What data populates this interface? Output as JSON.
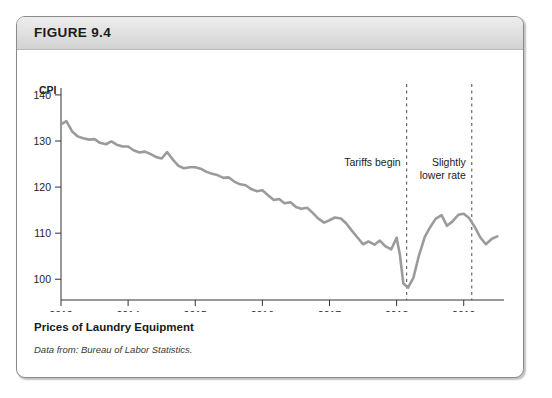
{
  "figure": {
    "label": "FIGURE 9.4",
    "caption_title": "Prices of Laundry Equipment",
    "caption_source": "Data from: Bureau of Labor Statistics."
  },
  "chart_data": {
    "type": "line",
    "title": "Prices of Laundry Equipment",
    "xlabel": "Year",
    "ylabel": "CPI",
    "xlim": [
      2013.0,
      2019.6
    ],
    "ylim": [
      95.5,
      141.5
    ],
    "grid": false,
    "legend": null,
    "x_tick_labels": [
      "2013",
      "2014",
      "2015",
      "2016",
      "2017",
      "2018",
      "2019"
    ],
    "x_ticks": [
      2013,
      2014,
      2015,
      2016,
      2017,
      2018,
      2019
    ],
    "y_tick_labels": [
      "140",
      "130",
      "120",
      "110",
      "100"
    ],
    "y_ticks": [
      140,
      130,
      120,
      110,
      100
    ],
    "series_name": "CPI for Laundry Equipment",
    "series_color": "#9b9b9b",
    "annotations": [
      {
        "text": "Tariffs begin",
        "x": 2018.15,
        "line": true
      },
      {
        "text": "Slightly lower rate",
        "x": 2019.12,
        "line": true
      }
    ],
    "points": [
      [
        2013.0,
        133.6
      ],
      [
        2013.08,
        134.3
      ],
      [
        2013.17,
        132.0
      ],
      [
        2013.25,
        131.0
      ],
      [
        2013.33,
        130.6
      ],
      [
        2013.42,
        130.3
      ],
      [
        2013.5,
        130.4
      ],
      [
        2013.58,
        129.6
      ],
      [
        2013.67,
        129.3
      ],
      [
        2013.75,
        129.9
      ],
      [
        2013.83,
        129.2
      ],
      [
        2013.92,
        128.8
      ],
      [
        2014.0,
        128.8
      ],
      [
        2014.08,
        128.0
      ],
      [
        2014.17,
        127.5
      ],
      [
        2014.25,
        127.7
      ],
      [
        2014.33,
        127.2
      ],
      [
        2014.42,
        126.5
      ],
      [
        2014.5,
        126.2
      ],
      [
        2014.58,
        127.6
      ],
      [
        2014.67,
        125.9
      ],
      [
        2014.75,
        124.6
      ],
      [
        2014.83,
        124.1
      ],
      [
        2014.92,
        124.3
      ],
      [
        2015.0,
        124.3
      ],
      [
        2015.08,
        124.0
      ],
      [
        2015.17,
        123.3
      ],
      [
        2015.25,
        122.9
      ],
      [
        2015.33,
        122.6
      ],
      [
        2015.42,
        122.0
      ],
      [
        2015.5,
        122.1
      ],
      [
        2015.58,
        121.2
      ],
      [
        2015.67,
        120.6
      ],
      [
        2015.75,
        120.4
      ],
      [
        2015.83,
        119.6
      ],
      [
        2015.92,
        119.1
      ],
      [
        2016.0,
        119.3
      ],
      [
        2016.08,
        118.3
      ],
      [
        2016.17,
        117.2
      ],
      [
        2016.25,
        117.4
      ],
      [
        2016.33,
        116.5
      ],
      [
        2016.42,
        116.7
      ],
      [
        2016.5,
        115.7
      ],
      [
        2016.58,
        115.3
      ],
      [
        2016.67,
        115.5
      ],
      [
        2016.75,
        114.4
      ],
      [
        2016.83,
        113.2
      ],
      [
        2016.92,
        112.3
      ],
      [
        2017.0,
        112.8
      ],
      [
        2017.08,
        113.4
      ],
      [
        2017.17,
        113.2
      ],
      [
        2017.25,
        112.1
      ],
      [
        2017.33,
        110.6
      ],
      [
        2017.42,
        109.0
      ],
      [
        2017.5,
        107.6
      ],
      [
        2017.58,
        108.2
      ],
      [
        2017.67,
        107.5
      ],
      [
        2017.75,
        108.4
      ],
      [
        2017.83,
        107.2
      ],
      [
        2017.92,
        106.5
      ],
      [
        2018.0,
        109.0
      ],
      [
        2018.05,
        105.2
      ],
      [
        2018.1,
        99.1
      ],
      [
        2018.17,
        98.2
      ],
      [
        2018.25,
        100.3
      ],
      [
        2018.33,
        105.0
      ],
      [
        2018.42,
        109.2
      ],
      [
        2018.5,
        111.3
      ],
      [
        2018.58,
        113.1
      ],
      [
        2018.67,
        113.9
      ],
      [
        2018.75,
        111.6
      ],
      [
        2018.83,
        112.5
      ],
      [
        2018.92,
        114.0
      ],
      [
        2019.0,
        114.2
      ],
      [
        2019.08,
        113.3
      ],
      [
        2019.17,
        111.2
      ],
      [
        2019.25,
        109.0
      ],
      [
        2019.33,
        107.6
      ],
      [
        2019.42,
        108.8
      ],
      [
        2019.5,
        109.3
      ]
    ]
  }
}
